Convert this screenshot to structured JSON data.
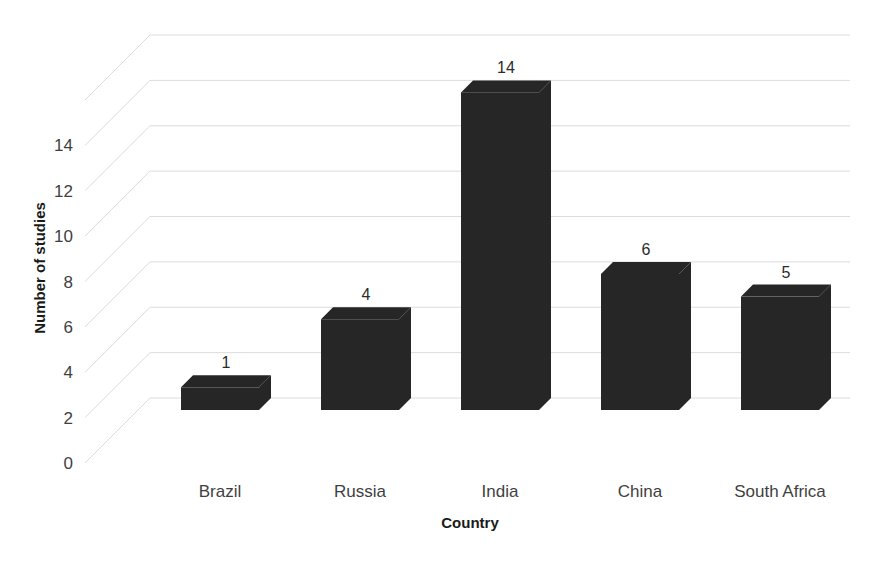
{
  "chart_data": {
    "type": "bar",
    "title": "",
    "subtitle": "",
    "xlabel": "Country",
    "ylabel": "Number of studies",
    "categories": [
      "Brazil",
      "Russia",
      "India",
      "China",
      "South Africa"
    ],
    "values": [
      1,
      4,
      14,
      6,
      5
    ],
    "value_labels": [
      "1",
      "4",
      "14",
      "6",
      "5"
    ],
    "series": [
      {
        "name": "Number of studies",
        "values": [
          1,
          4,
          14,
          6,
          5
        ]
      }
    ],
    "ylim": [
      0,
      16
    ],
    "ytick_values": [
      0,
      2,
      4,
      6,
      8,
      10,
      12,
      14
    ],
    "ytick_labels": [
      "0",
      "2",
      "4",
      "6",
      "8",
      "10",
      "12",
      "14"
    ],
    "gridlines": true,
    "grid_axis": "y",
    "legend": false,
    "legend_position": "none",
    "style": "3d-column",
    "bar_color": "#262626",
    "gridline_color": "#dcdcdc",
    "text_color": "#3f3f3f",
    "axis_title_color": "#1a1a1a",
    "background_color": "#ffffff",
    "annotations": "Data labels shown above each column"
  }
}
